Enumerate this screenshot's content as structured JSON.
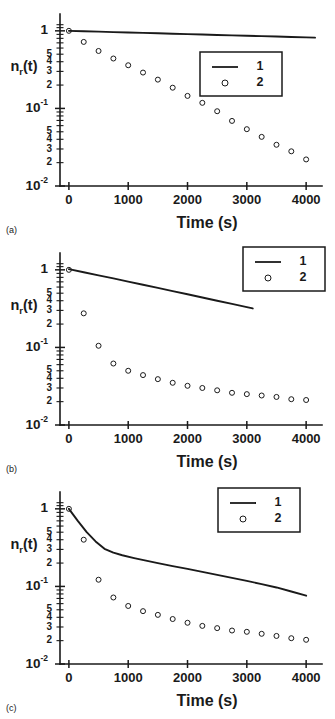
{
  "figure": {
    "panels": [
      {
        "letter": "(a)",
        "legend_position": "inside-right",
        "chart_data": {
          "type": "scatter",
          "title": "",
          "xlabel": "Time (s)",
          "ylabel": "n_r(t)",
          "xlim": [
            -150,
            4200
          ],
          "ylim": [
            0.01,
            1.3
          ],
          "yscale": "log",
          "grid": false,
          "legend": [
            "1",
            "2"
          ],
          "xticks": [
            0,
            1000,
            2000,
            3000,
            4000
          ],
          "xticklabels": [
            "0",
            "1000",
            "2000",
            "3000",
            "4000"
          ],
          "ytick_major": [
            1,
            0.1,
            0.01
          ],
          "ytick_major_labels": [
            "1",
            "10-1",
            "10-2"
          ],
          "ytick_minor_labels": [
            "5",
            "4",
            "3",
            "2"
          ],
          "series": [
            {
              "name": "1",
              "style": "line",
              "x": [
                0,
                250,
                500,
                750,
                1000,
                1250,
                1500,
                1750,
                2000,
                2250,
                2500,
                2750,
                3000,
                3250,
                3500,
                3750,
                4000,
                4150
              ],
              "y": [
                1.0,
                0.988,
                0.976,
                0.964,
                0.952,
                0.941,
                0.929,
                0.918,
                0.907,
                0.896,
                0.885,
                0.875,
                0.864,
                0.854,
                0.844,
                0.834,
                0.824,
                0.818
              ]
            },
            {
              "name": "2",
              "style": "markers",
              "x": [
                0,
                250,
                500,
                750,
                1000,
                1250,
                1500,
                1750,
                2000,
                2250,
                2500,
                2750,
                3000,
                3250,
                3500,
                3750,
                4000
              ],
              "y": [
                1.0,
                0.72,
                0.55,
                0.44,
                0.36,
                0.29,
                0.235,
                0.185,
                0.145,
                0.118,
                0.092,
                0.069,
                0.054,
                0.043,
                0.034,
                0.028,
                0.022
              ]
            }
          ]
        }
      },
      {
        "letter": "(b)",
        "legend_position": "outside-right",
        "chart_data": {
          "type": "scatter",
          "title": "",
          "xlabel": "Time (s)",
          "ylabel": "n_r(t)",
          "xlim": [
            -150,
            4200
          ],
          "ylim": [
            0.01,
            1.3
          ],
          "yscale": "log",
          "grid": false,
          "legend": [
            "1",
            "2"
          ],
          "xticks": [
            0,
            1000,
            2000,
            3000,
            4000
          ],
          "xticklabels": [
            "0",
            "1000",
            "2000",
            "3000",
            "4000"
          ],
          "ytick_major": [
            1,
            0.1,
            0.01
          ],
          "ytick_major_labels": [
            "1",
            "10-1",
            "10-2"
          ],
          "ytick_minor_labels": [
            "5",
            "4",
            "3",
            "2"
          ],
          "series": [
            {
              "name": "1",
              "style": "line",
              "x": [
                0,
                250,
                500,
                750,
                1000,
                1250,
                1500,
                1750,
                2000,
                2250,
                2500,
                2750,
                3000,
                3100
              ],
              "y": [
                1.02,
                0.93,
                0.85,
                0.775,
                0.705,
                0.642,
                0.585,
                0.532,
                0.484,
                0.44,
                0.4,
                0.364,
                0.331,
                0.318
              ]
            },
            {
              "name": "2",
              "style": "markers",
              "x": [
                0,
                250,
                500,
                750,
                1000,
                1250,
                1500,
                1750,
                2000,
                2250,
                2500,
                2750,
                3000,
                3250,
                3500,
                3750,
                4000
              ],
              "y": [
                1.0,
                0.275,
                0.105,
                0.062,
                0.05,
                0.044,
                0.039,
                0.035,
                0.032,
                0.03,
                0.028,
                0.026,
                0.025,
                0.024,
                0.023,
                0.0215,
                0.021
              ]
            }
          ]
        }
      },
      {
        "letter": "(c)",
        "legend_position": "inside-right",
        "chart_data": {
          "type": "scatter",
          "title": "",
          "xlabel": "Time (s)",
          "ylabel": "n_r(t)",
          "xlim": [
            -150,
            4200
          ],
          "ylim": [
            0.01,
            1.3
          ],
          "yscale": "log",
          "grid": false,
          "legend": [
            "1",
            "2"
          ],
          "xticks": [
            0,
            1000,
            2000,
            3000,
            4000
          ],
          "xticklabels": [
            "0",
            "1000",
            "2000",
            "3000",
            "4000"
          ],
          "ytick_major": [
            1,
            0.1,
            0.01
          ],
          "ytick_major_labels": [
            "1",
            "10-1",
            "10-2"
          ],
          "ytick_minor_labels": [
            "5",
            "4",
            "3",
            "2"
          ],
          "series": [
            {
              "name": "1",
              "style": "line",
              "x": [
                0,
                150,
                300,
                450,
                600,
                750,
                900,
                1100,
                1300,
                1500,
                1750,
                2000,
                2250,
                2500,
                2750,
                3000,
                3250,
                3500,
                3750,
                4000
              ],
              "y": [
                1.0,
                0.7,
                0.5,
                0.38,
                0.305,
                0.272,
                0.252,
                0.232,
                0.215,
                0.2,
                0.183,
                0.168,
                0.154,
                0.141,
                0.129,
                0.118,
                0.107,
                0.097,
                0.086,
                0.076
              ]
            },
            {
              "name": "2",
              "style": "markers",
              "x": [
                0,
                250,
                500,
                750,
                1000,
                1250,
                1500,
                1750,
                2000,
                2250,
                2500,
                2750,
                3000,
                3250,
                3500,
                3750,
                4000
              ],
              "y": [
                1.0,
                0.4,
                0.122,
                0.072,
                0.056,
                0.048,
                0.043,
                0.038,
                0.034,
                0.031,
                0.029,
                0.027,
                0.026,
                0.0245,
                0.023,
                0.0215,
                0.0205
              ]
            }
          ]
        }
      }
    ]
  }
}
